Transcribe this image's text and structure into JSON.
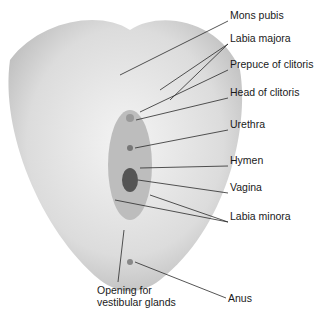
{
  "figure": {
    "colors": {
      "skin_light": "#ececec",
      "skin_mid": "#cfcfcf",
      "skin_dark": "#8a8a8a",
      "line": "#2a2a2a"
    }
  },
  "labels": [
    {
      "id": "mons-pubis",
      "text": "Mons pubis",
      "x": 230,
      "y": 15
    },
    {
      "id": "labia-majora",
      "text": "Labia majora",
      "x": 230,
      "y": 38
    },
    {
      "id": "prepuce-of-clitoris",
      "text": "Prepuce of clitoris",
      "x": 230,
      "y": 64
    },
    {
      "id": "head-of-clitoris",
      "text": "Head of clitoris",
      "x": 230,
      "y": 92
    },
    {
      "id": "urethra",
      "text": "Urethra",
      "x": 230,
      "y": 124
    },
    {
      "id": "hymen",
      "text": "Hymen",
      "x": 230,
      "y": 160
    },
    {
      "id": "vagina",
      "text": "Vagina",
      "x": 230,
      "y": 187
    },
    {
      "id": "labia-minora",
      "text": "Labia minora",
      "x": 230,
      "y": 216
    },
    {
      "id": "anus",
      "text": "Anus",
      "x": 228,
      "y": 292
    },
    {
      "id": "opening-for-vestibular-glands",
      "text": "Opening for vestibular glands",
      "x": 97,
      "y": 284
    }
  ]
}
